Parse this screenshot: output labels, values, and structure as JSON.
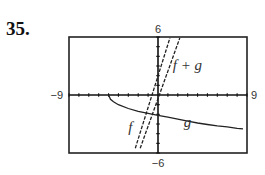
{
  "problem": {
    "number": "35."
  },
  "chart_data": {
    "type": "line",
    "title": "",
    "xlabel": "",
    "ylabel": "",
    "xlim": [
      -9,
      9
    ],
    "ylim": [
      -6,
      6
    ],
    "tick_labels": {
      "xmin": "−9",
      "xmax": "9",
      "ymin": "−6",
      "ymax": "6"
    },
    "x_tick_step": 1,
    "y_tick_step": 1,
    "grid": false,
    "legend": "inline labels",
    "series": [
      {
        "name": "f",
        "label": "f",
        "style": "dashed",
        "points": [
          [
            -2.3,
            -5.5
          ],
          [
            1.2,
            5.9
          ]
        ]
      },
      {
        "name": "f + g",
        "label": "f + g",
        "style": "dashed",
        "points": [
          [
            -1.8,
            -5.5
          ],
          [
            2.2,
            5.9
          ]
        ]
      },
      {
        "name": "g",
        "label": "g",
        "style": "solid",
        "points": [
          [
            -5,
            0
          ],
          [
            -4.8,
            -0.45
          ],
          [
            -4.5,
            -0.7
          ],
          [
            -4,
            -1.0
          ],
          [
            -3,
            -1.4
          ],
          [
            -2,
            -1.7
          ],
          [
            -1,
            -1.9
          ],
          [
            0,
            -2.1
          ],
          [
            1,
            -2.3
          ],
          [
            2,
            -2.5
          ],
          [
            3,
            -2.7
          ],
          [
            4,
            -2.9
          ],
          [
            5,
            -3.05
          ],
          [
            6,
            -3.2
          ],
          [
            7,
            -3.3
          ],
          [
            8,
            -3.45
          ],
          [
            8.6,
            -3.5
          ]
        ]
      }
    ],
    "annotations": [
      {
        "text": "f",
        "x": -3.0,
        "y": -3.8
      },
      {
        "text": "f + g",
        "x": 1.5,
        "y": 2.6
      },
      {
        "text": "g",
        "x": 2.6,
        "y": -3.3
      }
    ]
  }
}
